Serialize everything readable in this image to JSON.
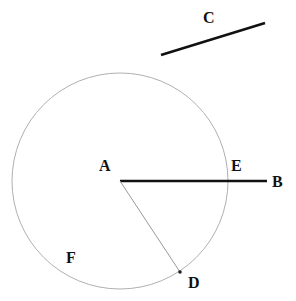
{
  "diagram": {
    "circle": {
      "cx": 120,
      "cy": 181,
      "r": 108,
      "stroke": "#aaaaaa"
    },
    "segments": [
      {
        "name": "AB",
        "x1": 120,
        "y1": 181,
        "x2": 267,
        "y2": 181,
        "stroke": "#111111",
        "width": 2.5
      },
      {
        "name": "C",
        "x1": 161,
        "y1": 55,
        "x2": 265,
        "y2": 23,
        "stroke": "#111111",
        "width": 2.5
      },
      {
        "name": "AD",
        "x1": 120,
        "y1": 181,
        "x2": 180,
        "y2": 272,
        "stroke": "#999999",
        "width": 1
      }
    ],
    "labels": {
      "A": "A",
      "B": "B",
      "C": "C",
      "D": "D",
      "E": "E",
      "F": "F"
    }
  }
}
